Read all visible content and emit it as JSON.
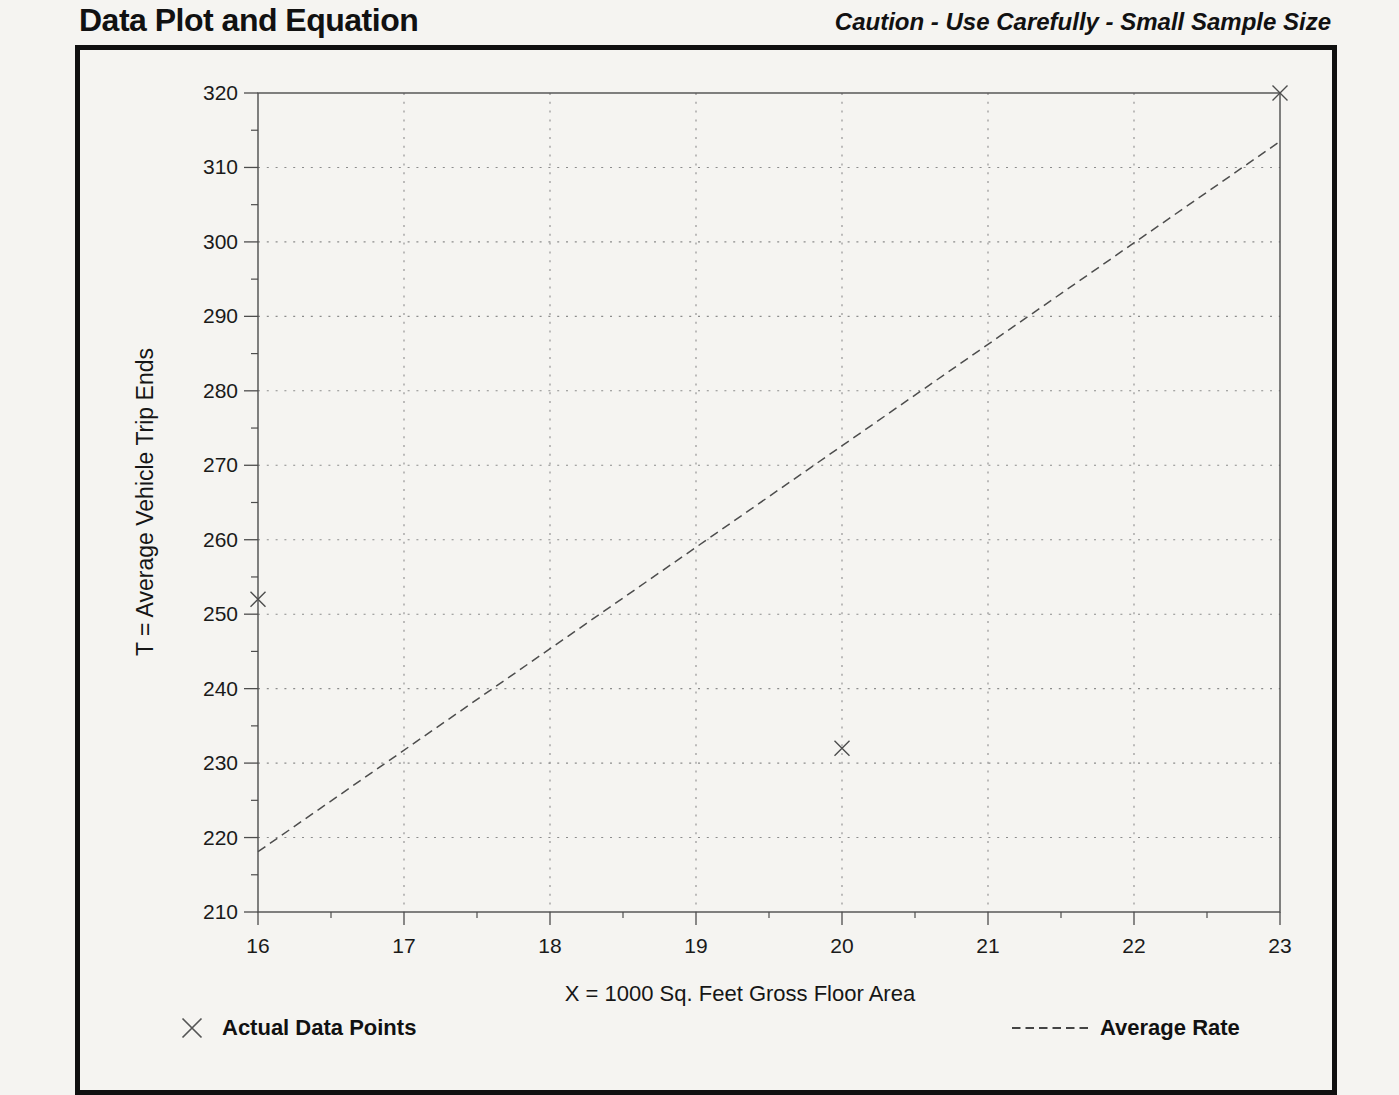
{
  "page": {
    "title": "Data Plot and Equation",
    "caution": "Caution - Use Carefully - Small Sample Size"
  },
  "chart_data": {
    "type": "scatter",
    "title": "Data Plot and Equation",
    "xlabel": "X = 1000 Sq. Feet Gross Floor Area",
    "ylabel": "T = Average Vehicle Trip Ends",
    "xlim": [
      16,
      23
    ],
    "ylim": [
      210,
      320
    ],
    "x_ticks": [
      16,
      17,
      18,
      19,
      20,
      21,
      22,
      23
    ],
    "y_ticks": [
      210,
      220,
      230,
      240,
      250,
      260,
      270,
      280,
      290,
      300,
      310,
      320
    ],
    "x_minor_step": 0.5,
    "y_minor_step": 5,
    "grid": {
      "style": "dotted",
      "x_lines": [
        17,
        18,
        19,
        20,
        21,
        22
      ],
      "y_lines": [
        220,
        230,
        240,
        250,
        260,
        270,
        280,
        290,
        300,
        310
      ]
    },
    "series": [
      {
        "name": "Actual Data Points",
        "kind": "scatter",
        "marker": "x",
        "points": [
          [
            16,
            252
          ],
          [
            20,
            232
          ],
          [
            23,
            320
          ]
        ]
      },
      {
        "name": "Average Rate",
        "kind": "line",
        "style": "dashed",
        "points": [
          [
            16,
            218.1
          ],
          [
            23,
            313.5
          ]
        ]
      }
    ],
    "legend": {
      "position": "bottom",
      "items": [
        {
          "marker": "x",
          "label": "Actual Data Points"
        },
        {
          "marker": "dashed-line",
          "label": "Average Rate"
        }
      ]
    }
  },
  "colors": {
    "ink": "#1a1a1a",
    "line": "#4d4d4d",
    "grid": "#8c8c8c",
    "paper": "#f5f4f1",
    "border": "#101010"
  }
}
